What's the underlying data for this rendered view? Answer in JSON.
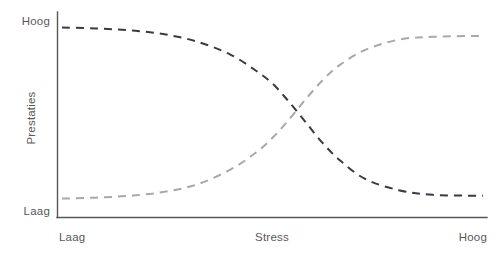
{
  "chart_data": {
    "type": "line",
    "title": "",
    "subtitle": "",
    "xlabel": "Stress",
    "ylabel": "Prestaties",
    "x_tick_labels": [
      "Laag",
      "Hoog"
    ],
    "y_tick_labels": [
      "Laag",
      "Hoog"
    ],
    "xlim": [
      0,
      1
    ],
    "ylim": [
      0,
      1
    ],
    "grid": false,
    "legend": "none",
    "annotations": [],
    "series": [
      {
        "name": "Dalende prestaties",
        "style": "dashed",
        "color": "#3a3a42",
        "x": [
          0.0,
          0.08,
          0.16,
          0.24,
          0.32,
          0.4,
          0.46,
          0.5,
          0.54,
          0.58,
          0.62,
          0.66,
          0.72,
          0.8,
          0.88,
          1.0
        ],
        "y": [
          0.96,
          0.955,
          0.945,
          0.925,
          0.885,
          0.815,
          0.73,
          0.66,
          0.56,
          0.45,
          0.34,
          0.25,
          0.15,
          0.09,
          0.065,
          0.06
        ]
      },
      {
        "name": "Stijgende prestaties",
        "style": "dashed",
        "color": "#a8a8ab",
        "x": [
          0.0,
          0.08,
          0.16,
          0.24,
          0.32,
          0.4,
          0.46,
          0.5,
          0.54,
          0.58,
          0.62,
          0.66,
          0.72,
          0.8,
          0.88,
          1.0
        ],
        "y": [
          0.045,
          0.05,
          0.06,
          0.08,
          0.12,
          0.2,
          0.29,
          0.37,
          0.47,
          0.58,
          0.68,
          0.76,
          0.84,
          0.895,
          0.91,
          0.915
        ]
      }
    ]
  },
  "colors": {
    "axis": "#58585c",
    "text": "#58585c",
    "series_descending": "#3a3a42",
    "series_ascending": "#a8a8ab",
    "background": "#ffffff"
  }
}
